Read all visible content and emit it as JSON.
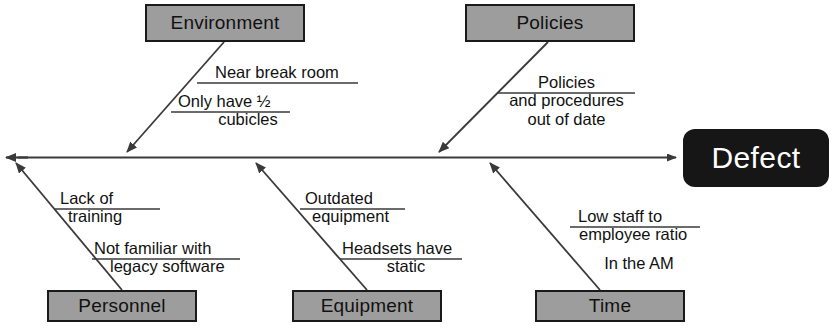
{
  "diagram": {
    "type": "fishbone-ishikawa",
    "effect": {
      "label": "Defect"
    },
    "categories": [
      {
        "id": "environment",
        "label": "Environment",
        "position": "top-left",
        "causes": [
          {
            "lines": [
              "Near break room"
            ],
            "underline_after": 0
          },
          {
            "lines": [
              "Only have ½",
              "cubicles"
            ],
            "underline_after": 0
          }
        ]
      },
      {
        "id": "policies",
        "label": "Policies",
        "position": "top-right",
        "causes": [
          {
            "lines": [
              "Policies",
              "and procedures",
              "out of date"
            ],
            "underline_after": 0
          }
        ]
      },
      {
        "id": "personnel",
        "label": "Personnel",
        "position": "bottom-left",
        "causes": [
          {
            "lines": [
              "Lack of",
              "training"
            ],
            "underline_after": 0
          },
          {
            "lines": [
              "Not familiar with",
              "legacy software"
            ],
            "underline_after": 0
          }
        ]
      },
      {
        "id": "equipment",
        "label": "Equipment",
        "position": "bottom-center",
        "causes": [
          {
            "lines": [
              "Outdated",
              "equipment"
            ],
            "underline_after": 0
          },
          {
            "lines": [
              "Headsets have",
              "static"
            ],
            "underline_after": 0
          }
        ]
      },
      {
        "id": "time",
        "label": "Time",
        "position": "bottom-right",
        "causes": [
          {
            "lines": [
              "Low staff to",
              "employee ratio"
            ],
            "underline_after": 0
          },
          {
            "lines": [
              "In the AM"
            ],
            "underline_after": -1
          }
        ]
      }
    ]
  },
  "labels": {
    "environment": "Environment",
    "policies": "Policies",
    "personnel": "Personnel",
    "equipment": "Equipment",
    "time": "Time",
    "defect": "Defect"
  },
  "causes": {
    "env_1_l1": "Near break room",
    "env_2_l1": "Only have ½",
    "env_2_l2": "cubicles",
    "pol_1_l1": "Policies",
    "pol_1_l2": "and procedures",
    "pol_1_l3": "out of date",
    "per_1_l1": "Lack of",
    "per_1_l2": "training",
    "per_2_l1": "Not familiar with",
    "per_2_l2": "legacy software",
    "equ_1_l1": "Outdated",
    "equ_1_l2": "equipment",
    "equ_2_l1": "Headsets have",
    "equ_2_l2": "static",
    "tim_1_l1": "Low staff to",
    "tim_1_l2": "employee ratio",
    "tim_2_l1": "In the AM"
  },
  "colors": {
    "category_fill": "#9d9d9d",
    "category_border": "#1a1a1a",
    "effect_fill": "#161616",
    "effect_text": "#ffffff",
    "line": "#3a3a3a",
    "text": "#111111",
    "background": "#ffffff"
  }
}
